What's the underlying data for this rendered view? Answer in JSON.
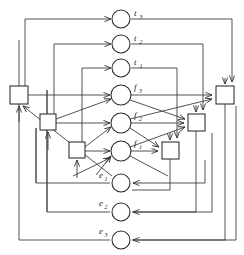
{
  "figure": {
    "kind": "logic-network-diagram",
    "title": "",
    "background_color": "#ffffff",
    "line_color": "#3f3f3f",
    "stroke_color": "#2b2b2b",
    "width": 244,
    "height": 255
  },
  "nodes": [
    {
      "id": "t3",
      "type": "circle",
      "base": "t",
      "subscript": "3",
      "label": "t3",
      "label_side": "right",
      "cx": 121,
      "cy": 19,
      "r": 9
    },
    {
      "id": "t2",
      "type": "circle",
      "base": "t",
      "subscript": "2",
      "label": "t2",
      "label_side": "right",
      "cx": 121,
      "cy": 44,
      "r": 9
    },
    {
      "id": "t1",
      "type": "circle",
      "base": "t",
      "subscript": "1",
      "label": "t1",
      "label_side": "right",
      "cx": 121,
      "cy": 68,
      "r": 9
    },
    {
      "id": "f3",
      "type": "circle",
      "base": "f",
      "subscript": "3",
      "label": "f3",
      "label_side": "right",
      "cx": 121,
      "cy": 95,
      "r": 10
    },
    {
      "id": "f2",
      "type": "circle",
      "base": "f",
      "subscript": "2",
      "label": "f2",
      "label_side": "right",
      "cx": 121,
      "cy": 123,
      "r": 10
    },
    {
      "id": "f1",
      "type": "circle",
      "base": "f",
      "subscript": "1",
      "label": "f1",
      "label_side": "right",
      "cx": 121,
      "cy": 151,
      "r": 10
    },
    {
      "id": "e1",
      "type": "circle",
      "base": "e",
      "subscript": "1",
      "label": "e1",
      "label_side": "left",
      "cx": 121,
      "cy": 183,
      "r": 9
    },
    {
      "id": "e2",
      "type": "circle",
      "base": "e",
      "subscript": "2",
      "label": "e2",
      "label_side": "left",
      "cx": 121,
      "cy": 212,
      "r": 9
    },
    {
      "id": "e3",
      "type": "circle",
      "base": "e",
      "subscript": "3",
      "label": "e3",
      "label_side": "left",
      "cx": 121,
      "cy": 240,
      "r": 9
    }
  ],
  "boxes": [
    {
      "id": "boxL3",
      "type": "square",
      "side": "left",
      "x": 10,
      "y": 86,
      "w": 18,
      "h": 18
    },
    {
      "id": "boxL2",
      "type": "square",
      "side": "left",
      "x": 40,
      "y": 114,
      "w": 16,
      "h": 16
    },
    {
      "id": "boxL1",
      "type": "square",
      "side": "left",
      "x": 69,
      "y": 142,
      "w": 16,
      "h": 16
    },
    {
      "id": "boxR3",
      "type": "square",
      "side": "right",
      "x": 216,
      "y": 86,
      "w": 18,
      "h": 18
    },
    {
      "id": "boxR2",
      "type": "square",
      "side": "right",
      "x": 188,
      "y": 114,
      "w": 17,
      "h": 17
    },
    {
      "id": "boxR1",
      "type": "square",
      "side": "right",
      "x": 162,
      "y": 142,
      "w": 17,
      "h": 17
    }
  ],
  "labels": {
    "t3": "t",
    "t2": "t",
    "t1": "t",
    "f3": "f",
    "f2": "f",
    "f1": "f",
    "e1": "e",
    "e2": "e",
    "e3": "e",
    "sub_3": "3",
    "sub_2": "2",
    "sub_1": "1"
  },
  "legend": {
    "circle_meaning": "signal node",
    "square_meaning": "gate element",
    "arrow_meaning": "directed connection"
  }
}
